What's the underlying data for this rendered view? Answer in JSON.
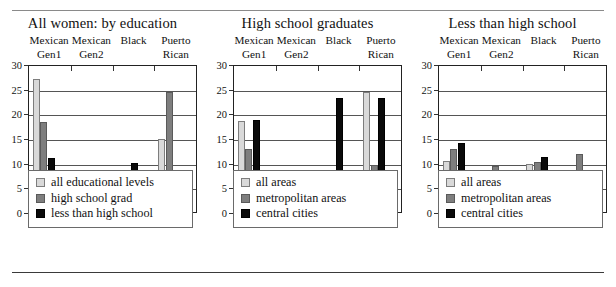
{
  "figure": {
    "panel_count": 3,
    "groups": [
      {
        "line1": "Mexican",
        "line2": "Gen1"
      },
      {
        "line1": "Mexican",
        "line2": "Gen2"
      },
      {
        "line1": "",
        "line2": "Black"
      },
      {
        "line1": "Puerto",
        "line2": "Rican"
      }
    ],
    "y_ticks": [
      "0",
      "5",
      "10",
      "15",
      "20",
      "25",
      "30"
    ],
    "colors": {
      "series_all": "#d9d9d9",
      "series_mid": "#7e7e7e",
      "series_dark": "#0a0a0a",
      "axis": "#222222",
      "grid": "#555555"
    }
  },
  "chart_data": [
    {
      "type": "bar",
      "title": "All women: by education",
      "xlabel": "",
      "ylabel": "",
      "ylim": [
        0,
        30
      ],
      "yticks": [
        0,
        5,
        10,
        15,
        20,
        25,
        30
      ],
      "grid": true,
      "legend_position": "below",
      "categories": [
        "Mexican Gen1",
        "Mexican Gen2",
        "Black",
        "Puerto Rican"
      ],
      "series": [
        {
          "name": "all educational levels",
          "color": "#d9d9d9",
          "values": [
            26.9,
            7.8,
            4.8,
            14.8
          ]
        },
        {
          "name": "high school grad",
          "color": "#7e7e7e",
          "values": [
            18.3,
            2.8,
            4.2,
            24.3
          ]
        },
        {
          "name": "less than high school",
          "color": "#0a0a0a",
          "values": [
            10.9,
            8.6,
            9.9,
            2.3
          ]
        }
      ]
    },
    {
      "type": "bar",
      "title": "High school graduates",
      "xlabel": "",
      "ylabel": "",
      "ylim": [
        0,
        30
      ],
      "yticks": [
        0,
        5,
        10,
        15,
        20,
        25,
        30
      ],
      "grid": true,
      "legend_position": "below",
      "categories": [
        "Mexican Gen1",
        "Mexican Gen2",
        "Black",
        "Puerto Rican"
      ],
      "series": [
        {
          "name": "all areas",
          "color": "#d9d9d9",
          "values": [
            18.5,
            2.6,
            4.1,
            24.3
          ]
        },
        {
          "name": "metropolitan areas",
          "color": "#7e7e7e",
          "values": [
            12.7,
            0.4,
            4.6,
            9.5
          ]
        },
        {
          "name": "central cities",
          "color": "#0a0a0a",
          "values": [
            18.6,
            0,
            23.2,
            23.2
          ]
        }
      ]
    },
    {
      "type": "bar",
      "title": "Less than high school",
      "xlabel": "",
      "ylabel": "",
      "ylim": [
        0,
        30
      ],
      "yticks": [
        0,
        5,
        10,
        15,
        20,
        25,
        30
      ],
      "grid": true,
      "legend_position": "below",
      "categories": [
        "Mexican Gen1",
        "Mexican Gen2",
        "Black",
        "Puerto Rican"
      ],
      "series": [
        {
          "name": "all areas",
          "color": "#d9d9d9",
          "values": [
            10.4,
            8.3,
            9.8,
            2.2
          ]
        },
        {
          "name": "metropolitan areas",
          "color": "#7e7e7e",
          "values": [
            12.8,
            9.4,
            10.2,
            11.7
          ]
        },
        {
          "name": "central cities",
          "color": "#0a0a0a",
          "values": [
            13.9,
            0,
            11.2,
            5.3
          ]
        }
      ]
    }
  ]
}
